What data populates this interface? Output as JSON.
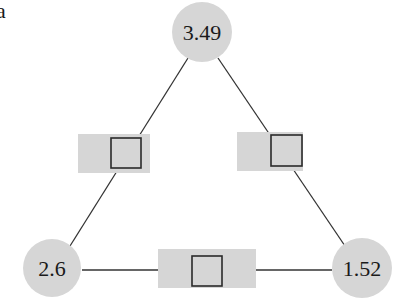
{
  "panel_label": "a",
  "colors": {
    "node_fill": "#d6d6d6",
    "box_fill": "#d6d6d6",
    "edge_stroke": "#333333",
    "square_stroke": "#2a2a2a",
    "text": "#1a1a1a"
  },
  "nodes": [
    {
      "id": "top",
      "label": "3.49",
      "cx": 202,
      "cy": 32,
      "r": 30
    },
    {
      "id": "left",
      "label": "2.6",
      "cx": 52,
      "cy": 268,
      "r": 29
    },
    {
      "id": "right",
      "label": "1.52",
      "cx": 362,
      "cy": 268,
      "r": 30
    }
  ],
  "edges": [
    {
      "id": "top-left",
      "x1": 188,
      "y1": 58,
      "x2": 70,
      "y2": 246
    },
    {
      "id": "top-right",
      "x1": 218,
      "y1": 58,
      "x2": 345,
      "y2": 246
    },
    {
      "id": "left-right",
      "x1": 82,
      "y1": 270,
      "x2": 332,
      "y2": 270
    }
  ],
  "edge_boxes": [
    {
      "id": "box-top-left",
      "x": 78,
      "y": 134,
      "w": 72,
      "h": 39,
      "sq_x": 111,
      "sq_y": 138,
      "sq_size": 30
    },
    {
      "id": "box-top-right",
      "x": 237,
      "y": 132,
      "w": 66,
      "h": 39,
      "sq_x": 271,
      "sq_y": 135,
      "sq_size": 31
    },
    {
      "id": "box-bottom",
      "x": 158,
      "y": 249,
      "w": 98,
      "h": 39,
      "sq_x": 192,
      "sq_y": 256,
      "sq_size": 30
    }
  ]
}
